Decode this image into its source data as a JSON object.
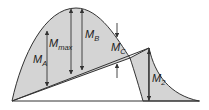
{
  "diagram": {
    "colors": {
      "fill": "#d4d4d4",
      "stroke": "#333333",
      "background": "#ffffff"
    },
    "labels": {
      "ma": {
        "main": "M",
        "sub": "A"
      },
      "mmax": {
        "main": "M",
        "sub": "max"
      },
      "mb": {
        "main": "M",
        "sub": "B"
      },
      "mc": {
        "main": "M",
        "sub": "C"
      },
      "m2": {
        "main": "M",
        "sub": "2"
      }
    }
  }
}
